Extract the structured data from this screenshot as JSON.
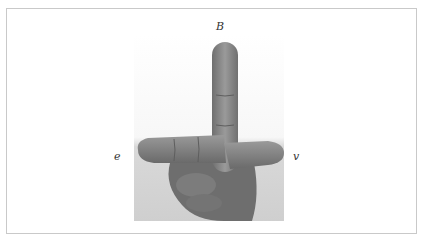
{
  "figure": {
    "labels": {
      "top": "B",
      "left": "e",
      "right": "v"
    },
    "colors": {
      "frame_border": "#c9c9c9",
      "background": "#ffffff",
      "skin": "#8a8a8a",
      "label": "#333333"
    }
  }
}
